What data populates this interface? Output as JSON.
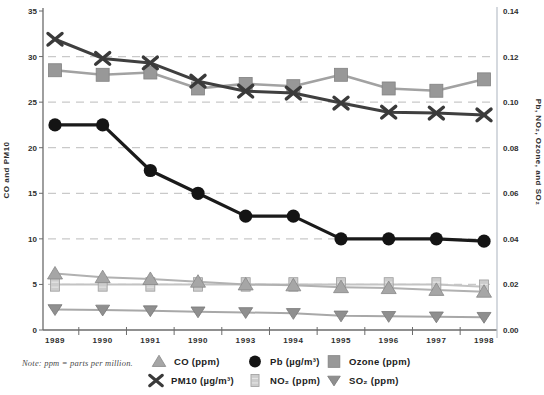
{
  "note": "Note: ppm = parts per million.",
  "legend": {
    "items": [
      {
        "label": "CO (ppm)",
        "series": "CO"
      },
      {
        "label": "Pb (µg/m³)",
        "series": "Pb"
      },
      {
        "label": "Ozone (ppm)",
        "series": "Ozone"
      },
      {
        "label": "PM10 (µg/m³)",
        "series": "PM10"
      },
      {
        "label": "NO₂ (ppm)",
        "series": "NO2"
      },
      {
        "label": "SO₂ (ppm)",
        "series": "SO2"
      }
    ]
  },
  "chart_data": {
    "type": "line",
    "years": [
      "1989",
      "1990",
      "1991",
      "1990",
      "1993",
      "1994",
      "1995",
      "1996",
      "1997",
      "1998"
    ],
    "left_axis": {
      "title": "CO and PM10",
      "ticks": [
        0,
        5,
        10,
        15,
        20,
        25,
        30,
        35
      ],
      "min": 0,
      "max": 35
    },
    "right_axis": {
      "title": "Pb, NO₂, Ozone, and SO₂",
      "ticks": [
        "0.00",
        "0.02",
        "0.04",
        "0.06",
        "0.08",
        "0.10",
        "0.12",
        "0.14"
      ],
      "min": 0,
      "max": 0.14
    },
    "grid": "dashed horizontal at left ticks 5-30",
    "legend_position": "bottom",
    "series": [
      {
        "name": "CO",
        "axis": "left",
        "marker": "triangle-up",
        "line_color": "#b1b1b1",
        "fill": "#a6a6a6",
        "edge": "#878787",
        "line_width": 2,
        "values": [
          6.2,
          5.8,
          5.6,
          5.3,
          5.0,
          4.9,
          4.7,
          4.6,
          4.4,
          4.2
        ]
      },
      {
        "name": "PM10",
        "axis": "left",
        "marker": "x",
        "line_color": "#3f3f3f",
        "fill": "#3a3a3a",
        "edge": "#3a3a3a",
        "line_width": 3,
        "values": [
          31.9,
          29.8,
          29.3,
          27.3,
          26.2,
          26.0,
          24.9,
          23.9,
          23.8,
          23.6
        ]
      },
      {
        "name": "Pb",
        "axis": "right",
        "marker": "circle",
        "line_color": "#1a1a1a",
        "fill": "#141414",
        "edge": "#141414",
        "line_width": 3.2,
        "values": [
          0.09,
          0.09,
          0.07,
          0.06,
          0.05,
          0.05,
          0.04,
          0.04,
          0.04,
          0.039
        ]
      },
      {
        "name": "NO2",
        "axis": "right",
        "marker": "bar-square",
        "line_color": "#c3c3c3",
        "fill": "#cccccc",
        "edge": "#9e9e9e",
        "line_width": 2,
        "values": [
          0.02,
          0.02,
          0.02,
          0.02,
          0.02,
          0.02,
          0.02,
          0.02,
          0.02,
          0.019
        ]
      },
      {
        "name": "Ozone",
        "axis": "right",
        "marker": "square",
        "line_color": "#a2a2a2",
        "fill": "#989898",
        "edge": "#828282",
        "line_width": 2.6,
        "values": [
          0.114,
          0.112,
          0.113,
          0.106,
          0.108,
          0.107,
          0.112,
          0.106,
          0.105,
          0.11
        ]
      },
      {
        "name": "SO2",
        "axis": "right",
        "marker": "triangle-down",
        "line_color": "#a8a8a8",
        "fill": "#8f8f8f",
        "edge": "#797979",
        "line_width": 2,
        "values": [
          0.009,
          0.0088,
          0.0085,
          0.008,
          0.0077,
          0.0073,
          0.0062,
          0.006,
          0.0058,
          0.0056
        ]
      }
    ],
    "draw_order": [
      "NO2",
      "CO",
      "SO2",
      "Ozone",
      "PM10",
      "Pb"
    ],
    "colors": {
      "grid": "#c9c9c9",
      "axis": "#6b6b6b",
      "right_axis_line": "#b9c0c9",
      "tick_text": "#2e2e2e"
    }
  }
}
